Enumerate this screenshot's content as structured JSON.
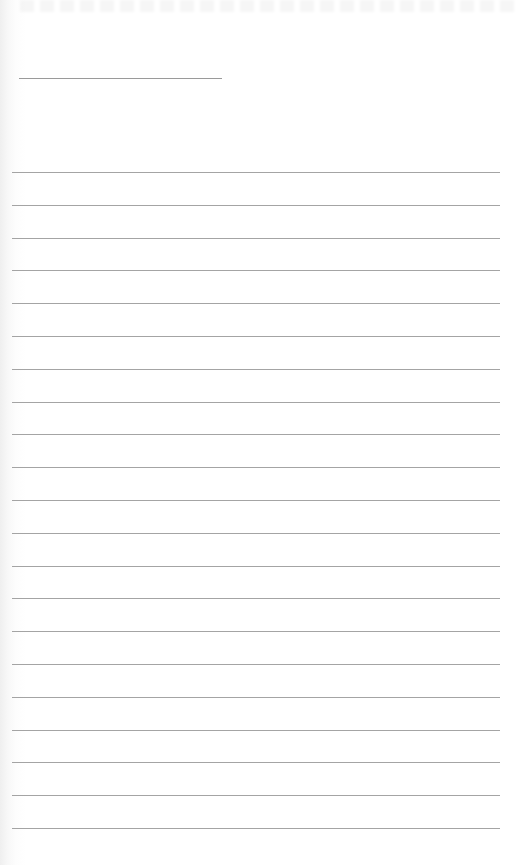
{
  "document": {
    "type": "lined-paper",
    "title_line": {
      "x": 19,
      "y": 78,
      "width": 203
    },
    "ruled_lines": {
      "count": 21,
      "first_y": 172,
      "spacing": 32.8,
      "x_start": 12,
      "x_end": 500
    },
    "colors": {
      "paper": "#ffffff",
      "rule": "#a4a4a4",
      "title_rule": "#9a9a9a"
    }
  }
}
